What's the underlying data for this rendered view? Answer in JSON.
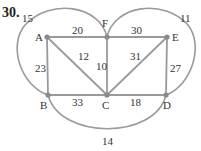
{
  "problem_number": "30.",
  "vertices": [
    {
      "id": "A",
      "label": "A",
      "x": 47,
      "y": 37,
      "lx": 35,
      "ly": 41
    },
    {
      "id": "F",
      "label": "F",
      "x": 107,
      "y": 37,
      "lx": 102,
      "ly": 27
    },
    {
      "id": "E",
      "label": "E",
      "x": 167,
      "y": 37,
      "lx": 172,
      "ly": 41
    },
    {
      "id": "B",
      "label": "B",
      "x": 48,
      "y": 95,
      "lx": 40,
      "ly": 109
    },
    {
      "id": "C",
      "label": "C",
      "x": 107,
      "y": 95,
      "lx": 102,
      "ly": 109
    },
    {
      "id": "D",
      "label": "D",
      "x": 166,
      "y": 95,
      "lx": 163,
      "ly": 109
    }
  ],
  "edges": [
    {
      "from": "A",
      "to": "F",
      "weight": "20",
      "wx": 72,
      "wy": 34
    },
    {
      "from": "F",
      "to": "E",
      "weight": "30",
      "wx": 131,
      "wy": 34
    },
    {
      "from": "A",
      "to": "B",
      "weight": "23",
      "wx": 35,
      "wy": 72
    },
    {
      "from": "A",
      "to": "C",
      "weight": "12",
      "wx": 78,
      "wy": 60
    },
    {
      "from": "F",
      "to": "C",
      "weight": "10",
      "wx": 96,
      "wy": 70
    },
    {
      "from": "E",
      "to": "C",
      "weight": "31",
      "wx": 130,
      "wy": 60
    },
    {
      "from": "E",
      "to": "D",
      "weight": "27",
      "wx": 170,
      "wy": 72
    },
    {
      "from": "B",
      "to": "C",
      "weight": "33",
      "wx": 72,
      "wy": 106
    },
    {
      "from": "C",
      "to": "D",
      "weight": "18",
      "wx": 130,
      "wy": 106
    },
    {
      "from": "F",
      "to": "B",
      "weight": "15",
      "wx": 22,
      "wy": 22,
      "curved": "left-arc"
    },
    {
      "from": "F",
      "to": "D",
      "weight": "11",
      "wx": 180,
      "wy": 22,
      "curved": "right-arc"
    },
    {
      "from": "B",
      "to": "D",
      "weight": "14",
      "wx": 102,
      "wy": 145,
      "curved": "bottom-arc"
    }
  ],
  "colors": {
    "edge": "#9a9a9a",
    "vertex": "#8a8a8a",
    "text": "#333333"
  }
}
